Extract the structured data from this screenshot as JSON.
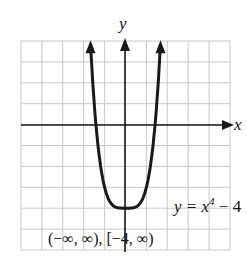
{
  "chart_data": {
    "type": "line",
    "title": "",
    "xlabel": "x",
    "ylabel": "y",
    "xlim": [
      -5,
      5
    ],
    "ylim": [
      -6,
      4
    ],
    "grid": true,
    "series": [
      {
        "name": "y = x^4 - 4",
        "function": "x^4 - 4",
        "x": [
          -1.68,
          -1.5,
          -1.25,
          -1,
          -0.75,
          -0.5,
          -0.25,
          0,
          0.25,
          0.5,
          0.75,
          1,
          1.25,
          1.5,
          1.68
        ],
        "values": [
          4,
          1.06,
          -1.56,
          -3,
          -3.68,
          -3.94,
          -4,
          -4,
          -4,
          -3.94,
          -3.68,
          -3,
          -1.56,
          1.06,
          4
        ]
      }
    ],
    "annotations": [
      "y = x⁴ − 4",
      "(−∞, ∞), [−4, ∞)"
    ]
  },
  "labels": {
    "y_axis": "y",
    "x_axis": "x",
    "equation_base": "y = x",
    "equation_exp": "4",
    "equation_tail": " − 4",
    "domain_range": "(−∞, ∞), [−4, ∞)"
  },
  "colors": {
    "curve": "#1a1a1a",
    "grid": "#c8c8c8",
    "axis": "#1a1a1a"
  }
}
